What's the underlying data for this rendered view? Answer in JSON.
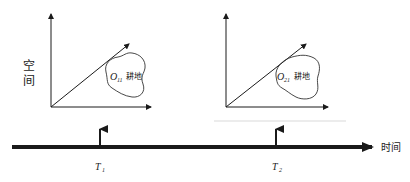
{
  "diagram": {
    "space_axis_label": [
      "空",
      "间"
    ],
    "time_axis_label": "时间",
    "panels": [
      {
        "id": "panel-1",
        "object_label": {
          "symbol": "O",
          "subscript": "11",
          "type": "耕地"
        },
        "time_marker": {
          "symbol": "T",
          "subscript": "1"
        }
      },
      {
        "id": "panel-2",
        "object_label": {
          "symbol": "O",
          "subscript": "21",
          "type": "耕地"
        },
        "time_marker": {
          "symbol": "T",
          "subscript": "2"
        }
      }
    ]
  },
  "colors": {
    "line": "#1a1a1a",
    "blob": "#333333",
    "faint_line": "#cfcfcf"
  }
}
